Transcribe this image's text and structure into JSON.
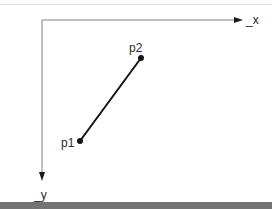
{
  "figure": {
    "background_color": "#ffffff",
    "top_rule_color": "#e2e2e2",
    "bottom_band_color": "#737373"
  },
  "axes": {
    "origin": {
      "x": 42,
      "y": 20
    },
    "color": "#808080",
    "x_axis": {
      "label": "_x",
      "label_position": {
        "x": 246,
        "y": 24
      },
      "start": {
        "x": 42,
        "y": 20
      },
      "end": {
        "x": 234,
        "y": 20
      },
      "arrow_tip": {
        "x": 242,
        "y": 20
      },
      "direction": "right"
    },
    "y_axis": {
      "label": "_y",
      "label_position": {
        "x": 36,
        "y": 198
      },
      "start": {
        "x": 42,
        "y": 20
      },
      "end": {
        "x": 42,
        "y": 172
      },
      "arrow_tip": {
        "x": 42,
        "y": 182
      },
      "direction": "down"
    }
  },
  "segment": {
    "color": "#141414",
    "width": 2,
    "from": "p1",
    "to": "p2"
  },
  "points": [
    {
      "id": "p1",
      "label": "p1",
      "marker": {
        "x": 80,
        "y": 141,
        "r": 3
      },
      "label_position": {
        "x": 62,
        "y": 146
      },
      "color": "#141414"
    },
    {
      "id": "p2",
      "label": "p2",
      "marker": {
        "x": 141,
        "y": 58,
        "r": 3
      },
      "label_position": {
        "x": 129,
        "y": 52
      },
      "color": "#141414"
    }
  ]
}
